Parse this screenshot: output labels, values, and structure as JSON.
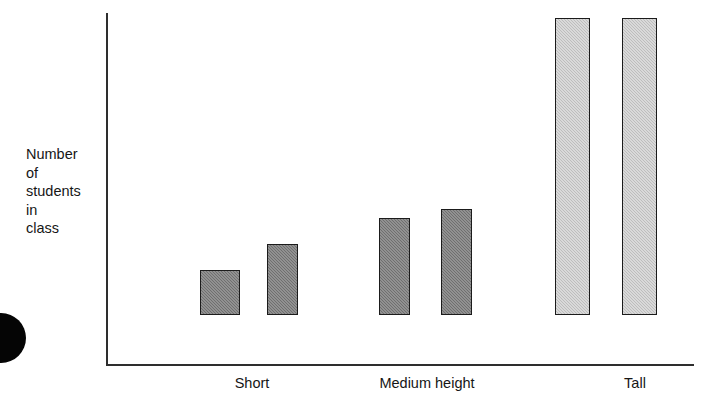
{
  "chart_data": {
    "type": "bar",
    "title": "",
    "subtitle": "",
    "xlabel": "",
    "ylabel": "Number of students in class",
    "ylabel_lines": [
      "Number",
      "of",
      "students",
      "in",
      "class"
    ],
    "categories": [
      "Short",
      "Medium height",
      "Tall"
    ],
    "grid": false,
    "legend": null,
    "axis_ranges": {
      "ylim": [
        0,
        100
      ],
      "y_ticks": [],
      "x_ticks_shown": false
    },
    "series": [
      {
        "name": "bar-1",
        "values": [
          13,
          28,
          100
        ]
      },
      {
        "name": "bar-2",
        "values": [
          20,
          30,
          100
        ]
      }
    ],
    "bars": [
      {
        "id": "short-bar-1",
        "category": "Short",
        "index_in_group": 1,
        "value": 13,
        "shade": "dark",
        "color": "#7c7c7c",
        "x": 200,
        "width": 40,
        "top": 320
      },
      {
        "id": "short-bar-2",
        "category": "Short",
        "index_in_group": 2,
        "value": 20,
        "shade": "dark",
        "color": "#7c7c7c",
        "x": 267,
        "width": 31,
        "top": 294
      },
      {
        "id": "medium-bar-1",
        "category": "Medium height",
        "index_in_group": 1,
        "value": 28,
        "shade": "dark",
        "color": "#7c7c7c",
        "x": 379,
        "width": 31,
        "top": 268
      },
      {
        "id": "medium-bar-2",
        "category": "Medium height",
        "index_in_group": 2,
        "value": 30,
        "shade": "dark",
        "color": "#7c7c7c",
        "x": 441,
        "width": 31,
        "top": 259
      },
      {
        "id": "tall-bar-1",
        "category": "Tall",
        "index_in_group": 1,
        "value": 100,
        "shade": "light",
        "color": "#c9c9c9",
        "x": 555,
        "width": 35,
        "top": 68
      },
      {
        "id": "tall-bar-2",
        "category": "Tall",
        "index_in_group": 2,
        "value": 100,
        "shade": "light",
        "color": "#c9c9c9",
        "x": 622,
        "width": 35,
        "top": 68
      }
    ],
    "category_label_positions": [
      252,
      427,
      635
    ]
  },
  "colors": {
    "background": "#ffffff",
    "axis": "#2e2e2e",
    "text": "#161616",
    "bar_dark": "#7c7c7c",
    "bar_light": "#c9c9c9",
    "bar_outline": "#1b1b1b",
    "scan_artifact": "#050505"
  },
  "artifacts": {
    "scan_blob_name": "scan-edge-blob"
  }
}
